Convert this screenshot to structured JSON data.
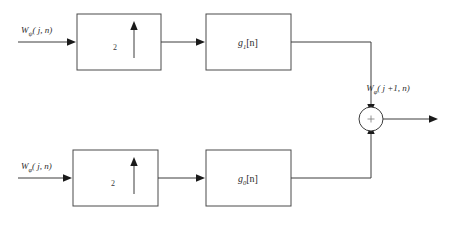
{
  "diagram": {
    "colors": {
      "stroke": "#3d3d3d",
      "block_stroke": "#4a4a4a",
      "arrow_fill": "#1a1a1a",
      "background": "#ffffff",
      "text": "#2b2b2b"
    },
    "top_branch": {
      "input_label": {
        "base": "W",
        "subscript": "ψ",
        "args": "( j, n)"
      },
      "upsampler": {
        "factor": "2",
        "icon": "up-arrow-icon"
      },
      "filter": {
        "base": "g",
        "subscript": "1",
        "bracket": "[n]"
      }
    },
    "bottom_branch": {
      "input_label": {
        "base": "W",
        "subscript": "φ",
        "args": "( j, n)"
      },
      "upsampler": {
        "factor": "2",
        "icon": "up-arrow-icon"
      },
      "filter": {
        "base": "g",
        "subscript": "0",
        "bracket": "[n]"
      }
    },
    "summing_junction": {
      "operator": "+"
    },
    "output_label": {
      "base": "W",
      "subscript": "φ",
      "args": "( j +1, n)"
    }
  }
}
